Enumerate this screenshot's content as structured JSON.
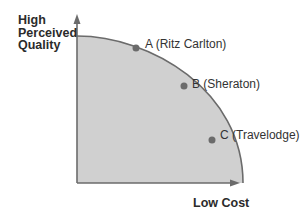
{
  "diagram": {
    "type": "frontier-curve",
    "y_axis_label": [
      "High",
      "Perceived",
      "Quality"
    ],
    "x_axis_label": "Low Cost",
    "points": [
      {
        "id": "A",
        "label": "A (Ritz Carlton)"
      },
      {
        "id": "B",
        "label": "B (Sheraton)"
      },
      {
        "id": "C",
        "label": "C (Travelodge)"
      }
    ],
    "colors": {
      "fill": "#cfcfcf",
      "curve": "#6b6b6b",
      "axis": "#6b6b6b",
      "point": "#6b6b6b"
    }
  }
}
